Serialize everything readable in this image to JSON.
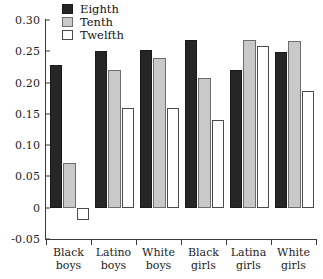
{
  "chart_data": {
    "type": "bar",
    "title": "",
    "xlabel": "",
    "ylabel": "",
    "ylim": [
      -0.05,
      0.3
    ],
    "grid": false,
    "legend_position": "top-left",
    "categories": [
      "Black boys",
      "Latino boys",
      "White boys",
      "Black girls",
      "Latina girls",
      "White girls"
    ],
    "category_lines": [
      [
        "Black",
        "boys"
      ],
      [
        "Latino",
        "boys"
      ],
      [
        "White",
        "boys"
      ],
      [
        "Black",
        "girls"
      ],
      [
        "Latina",
        "girls"
      ],
      [
        "White",
        "girls"
      ]
    ],
    "ytick_labels": [
      "0.30",
      "0.25",
      "0.20",
      "0.15",
      "0.10",
      "0.05",
      "0",
      "-0.05"
    ],
    "ytick_values": [
      0.3,
      0.25,
      0.2,
      0.15,
      0.1,
      0.05,
      0,
      -0.05
    ],
    "series": [
      {
        "name": "Eighth",
        "color": "#262626",
        "values": [
          0.228,
          0.251,
          0.252,
          0.268,
          0.22,
          0.249
        ]
      },
      {
        "name": "Tenth",
        "color": "#c9c9c9",
        "values": [
          0.071,
          0.22,
          0.24,
          0.208,
          0.268,
          0.267
        ]
      },
      {
        "name": "Twelfth",
        "color": "#ffffff",
        "values": [
          -0.02,
          0.16,
          0.16,
          0.14,
          0.258,
          0.187
        ]
      }
    ]
  },
  "legend": {
    "items": [
      {
        "label": "Eighth",
        "swatch": "eighth"
      },
      {
        "label": "Tenth",
        "swatch": "tenth"
      },
      {
        "label": "Twelfth",
        "swatch": "twelfth"
      }
    ]
  }
}
